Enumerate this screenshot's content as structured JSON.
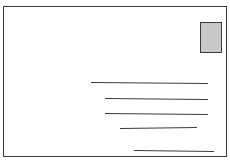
{
  "illustration": {
    "subject": "envelope-postcard",
    "colors": {
      "outline": "#3a3a3a",
      "background": "#ffffff",
      "stamp_fill": "#c8c8c8"
    },
    "envelope": {
      "x": 3,
      "y": 6,
      "width": 224,
      "height": 151
    },
    "stamp": {
      "x": 200,
      "y": 22,
      "width": 22,
      "height": 31
    },
    "address_lines": [
      {
        "x1": 91,
        "y1": 82,
        "x2": 208,
        "y2": 83
      },
      {
        "x1": 105,
        "y1": 98,
        "x2": 208,
        "y2": 99
      },
      {
        "x1": 105,
        "y1": 113,
        "x2": 208,
        "y2": 114
      },
      {
        "x1": 120,
        "y1": 128,
        "x2": 197,
        "y2": 127
      },
      {
        "x1": 134,
        "y1": 150,
        "x2": 214,
        "y2": 151
      }
    ]
  }
}
